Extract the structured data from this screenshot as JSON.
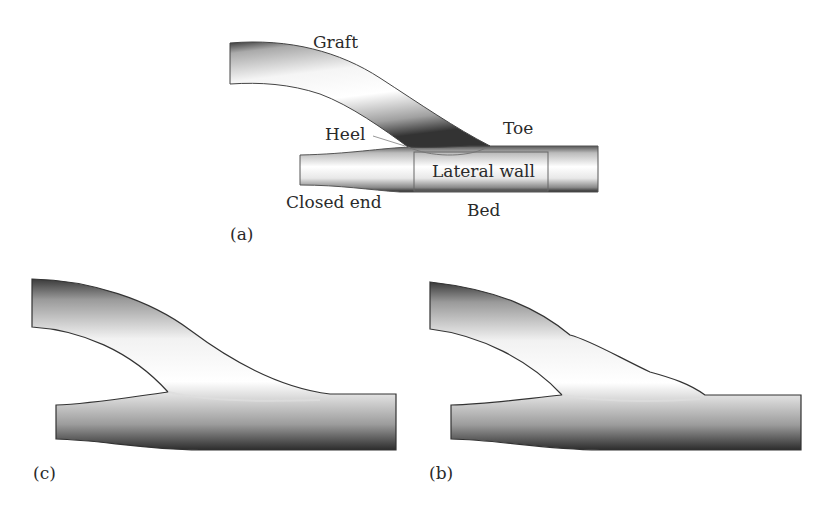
{
  "figure": {
    "panels": [
      {
        "id": "a",
        "label": "(a)",
        "annotations": {
          "graft": "Graft",
          "heel": "Heel",
          "toe": "Toe",
          "lateral_wall": "Lateral wall",
          "closed_end": "Closed end",
          "bed": "Bed"
        }
      },
      {
        "id": "c",
        "label": "(c)"
      },
      {
        "id": "b",
        "label": "(b)"
      }
    ]
  }
}
